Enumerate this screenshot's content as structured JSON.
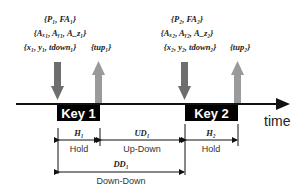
{
  "diagram": {
    "time_label": "time",
    "keys": [
      {
        "label": "Key 1",
        "down_params": [
          "{P₁, FA₁}",
          "{Aₓ₁, Aᵧ₁, A_z₁}",
          "{x₁, y₁, tdown₁}"
        ],
        "up_params": "{tup₁}"
      },
      {
        "label": "Key 2",
        "down_params": [
          "{P₂, FA₂}",
          "{Aₓ₂, Aᵧ₂, A_z₂}",
          "{x₂, y₂, tdown₂}"
        ],
        "up_params": "{tup₂}"
      }
    ],
    "intervals": {
      "h1": {
        "symbol": "H₁",
        "label": "Hold"
      },
      "ud1": {
        "symbol": "UD₁",
        "label": "Up-Down"
      },
      "h2": {
        "symbol": "H₂",
        "label": "Hold"
      },
      "dd1": {
        "symbol": "DD₁",
        "label": "Down-Down"
      }
    },
    "colors": {
      "down_arrow": "#6e6e6e",
      "up_arrow": "#9a9a9a",
      "key_box": "#000000",
      "line": "#111111"
    }
  }
}
